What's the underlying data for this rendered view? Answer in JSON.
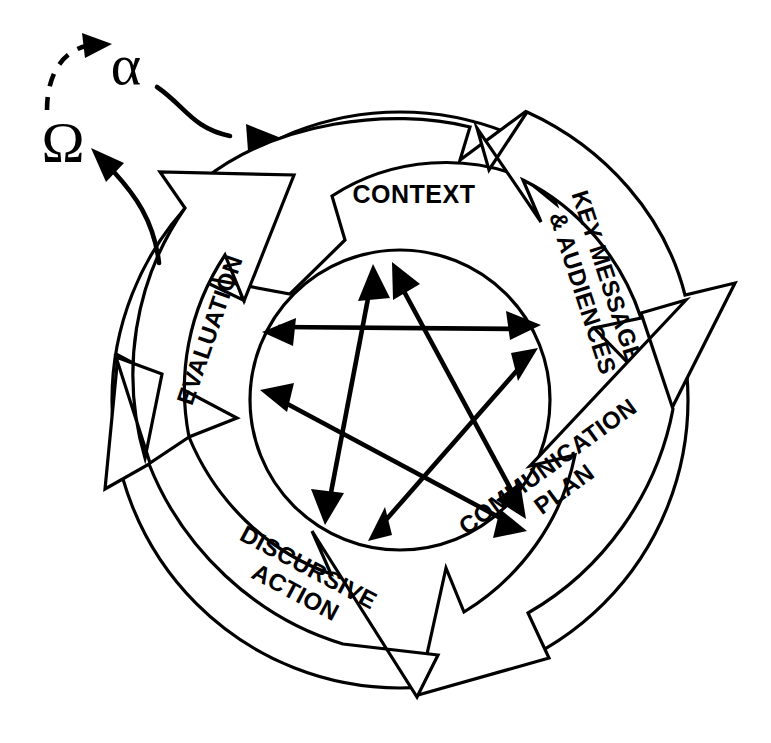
{
  "diagram": {
    "type": "cyclical-process-diagram",
    "stroke_color": "#000000",
    "fill_color": "#ffffff",
    "background": "#ffffff",
    "ring_segments": [
      {
        "id": "context",
        "label": "CONTEXT",
        "lines": [
          "CONTEXT"
        ],
        "position": "top",
        "text_rotation_deg": 0
      },
      {
        "id": "key-messages-audiences",
        "label": "KEY MESSAGES & AUDIENCES",
        "lines": [
          "KEY MESSAGES",
          "& AUDIENCES"
        ],
        "position": "top-right",
        "text_rotation_deg": 72
      },
      {
        "id": "communication-plan",
        "label": "COMMUNICATION PLAN",
        "lines": [
          "COMMUNICATION",
          "PLAN"
        ],
        "position": "bottom-right",
        "text_rotation_deg": 144
      },
      {
        "id": "discursive-action",
        "label": "DISCURSIVE ACTION",
        "lines": [
          "DISCURSIVE",
          "ACTION"
        ],
        "position": "bottom-left",
        "text_rotation_deg": 216
      },
      {
        "id": "evaluation",
        "label": "EVALUATION",
        "lines": [
          "EVALUATION"
        ],
        "position": "left",
        "text_rotation_deg": 288
      }
    ],
    "greek_markers": [
      {
        "id": "alpha",
        "symbol": "α",
        "name": "alpha",
        "meaning": "entry point into the cycle"
      },
      {
        "id": "omega",
        "symbol": "Ω",
        "name": "omega",
        "meaning": "exit point from the cycle"
      }
    ],
    "flow_connectors": [
      {
        "id": "omega-to-alpha",
        "from": "omega",
        "to": "alpha",
        "style": "dashed",
        "arrowheads": 1
      },
      {
        "id": "alpha-to-cycle",
        "from": "alpha",
        "to": "context",
        "style": "solid",
        "arrowheads": 1
      },
      {
        "id": "cycle-to-omega",
        "from": "evaluation",
        "to": "omega",
        "style": "solid",
        "arrowheads": 1
      }
    ],
    "inner_star": {
      "description": "Five double-headed arrows forming a pentagram linking every stage to every other stage",
      "arrow_count": 5,
      "arrowheads_per_arrow": 2,
      "connections": [
        {
          "from": "context",
          "to": "communication-plan"
        },
        {
          "from": "key-messages-audiences",
          "to": "discursive-action"
        },
        {
          "from": "communication-plan",
          "to": "evaluation"
        },
        {
          "from": "discursive-action",
          "to": "context"
        },
        {
          "from": "evaluation",
          "to": "key-messages-audiences"
        }
      ]
    }
  }
}
